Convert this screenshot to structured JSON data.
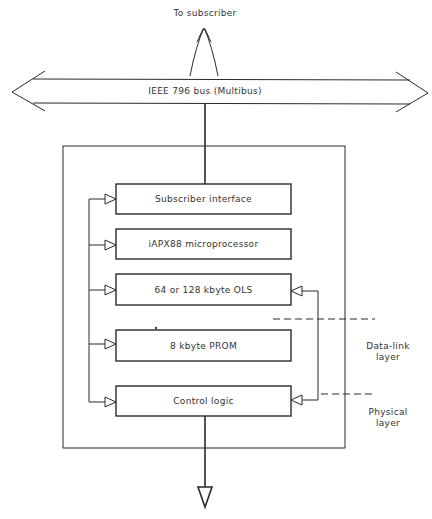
{
  "diagram": {
    "top_label": "To subscriber",
    "bus_label": "IEEE 796 bus (Multibus)",
    "blocks": [
      {
        "label": "Subscriber interface",
        "y": 184
      },
      {
        "label": "iAPX88 microprocessor",
        "y": 229
      },
      {
        "label": "64 or 128 kbyte OLS",
        "y": 274
      },
      {
        "label": "8 kbyte PROM",
        "y": 330
      },
      {
        "label": "Control logic",
        "y": 386
      }
    ],
    "layers": [
      {
        "line1": "Data-link",
        "line2": "layer"
      },
      {
        "line1": "Physical",
        "line2": "layer"
      }
    ],
    "colors": {
      "stroke": "#2a2a2a",
      "background": "#ffffff"
    }
  }
}
